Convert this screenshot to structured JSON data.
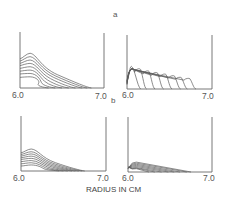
{
  "figure": {
    "panel_labels": {
      "a": "a",
      "b": "b"
    },
    "xlabel": "RADIUS IN CM"
  },
  "chart_data": [
    {
      "type": "line",
      "id": "a-left",
      "panel": "a",
      "title": "",
      "xlabel": "RADIUS IN CM",
      "ylabel": "",
      "xlim": [
        6.0,
        7.0
      ],
      "x_ticks": [
        "6.0",
        "7.0"
      ],
      "grid": false,
      "description": "Family of 8 sedimentation boundary profiles, broad peak near 6.1 cm, decaying toward 7.0 cm",
      "frame": {
        "x0": 20,
        "x1": 104,
        "ytop": 32,
        "ybase": 88
      },
      "series_count": 8,
      "peak_x": 6.12,
      "peak_heights": [
        0.62,
        0.56,
        0.5,
        0.44,
        0.38,
        0.32,
        0.26,
        0.2
      ],
      "left_heights": [
        0.52,
        0.48,
        0.44,
        0.4,
        0.35,
        0.3,
        0.25,
        0.19
      ],
      "end_x": [
        6.85,
        6.8,
        6.74,
        6.66,
        6.58,
        6.5,
        6.42,
        6.34
      ]
    },
    {
      "type": "line",
      "id": "a-right",
      "panel": "a",
      "title": "",
      "xlabel": "RADIUS IN CM",
      "xlim": [
        6.0,
        7.0
      ],
      "x_ticks": [
        "6.0",
        "7.0"
      ],
      "grid": false,
      "description": "Family of 8 profiles: sharp early peak near 6.05 cm then a traveling boundary peak moving outward",
      "frame": {
        "x0": 127,
        "x1": 212,
        "ytop": 35,
        "ybase": 89
      },
      "series_count": 8,
      "peak_positions": [
        6.05,
        6.14,
        6.24,
        6.34,
        6.44,
        6.54,
        6.62,
        6.72
      ],
      "peak_heights": [
        0.42,
        0.38,
        0.34,
        0.31,
        0.28,
        0.25,
        0.22,
        0.2
      ]
    },
    {
      "type": "line",
      "id": "b-left",
      "panel": "b",
      "title": "",
      "xlabel": "RADIUS IN CM",
      "xlim": [
        6.0,
        7.0
      ],
      "x_ticks": [
        "6.0",
        "7.0"
      ],
      "grid": false,
      "description": "Family of 8 lower-amplitude profiles with peak near 6.12 cm decaying to ~6.75 cm",
      "frame": {
        "x0": 21,
        "x1": 106,
        "ytop": 116,
        "ybase": 171
      },
      "series_count": 8,
      "peak_x": 6.12,
      "peak_heights": [
        0.4,
        0.35,
        0.31,
        0.27,
        0.23,
        0.19,
        0.15,
        0.11
      ],
      "left_heights": [
        0.33,
        0.3,
        0.27,
        0.24,
        0.21,
        0.17,
        0.13,
        0.09
      ],
      "end_x": [
        6.75,
        6.72,
        6.68,
        6.64,
        6.6,
        6.55,
        6.5,
        6.45
      ]
    },
    {
      "type": "line",
      "id": "b-right",
      "panel": "b",
      "title": "",
      "xlabel": "RADIUS IN CM",
      "xlim": [
        6.0,
        7.0
      ],
      "x_ticks": [
        "6.0",
        "7.0"
      ],
      "grid": false,
      "description": "Family of 8 very low-amplitude profiles, small peak near 6.08 cm and shallow linear decay",
      "frame": {
        "x0": 128,
        "x1": 212,
        "ytop": 117,
        "ybase": 172
      },
      "series_count": 8,
      "peak_x": 6.1,
      "peak_heights": [
        0.18,
        0.16,
        0.14,
        0.12,
        0.1,
        0.08,
        0.07,
        0.06
      ],
      "end_x": [
        6.75,
        6.7,
        6.62,
        6.55,
        6.48,
        6.4,
        6.32,
        6.25
      ]
    }
  ]
}
